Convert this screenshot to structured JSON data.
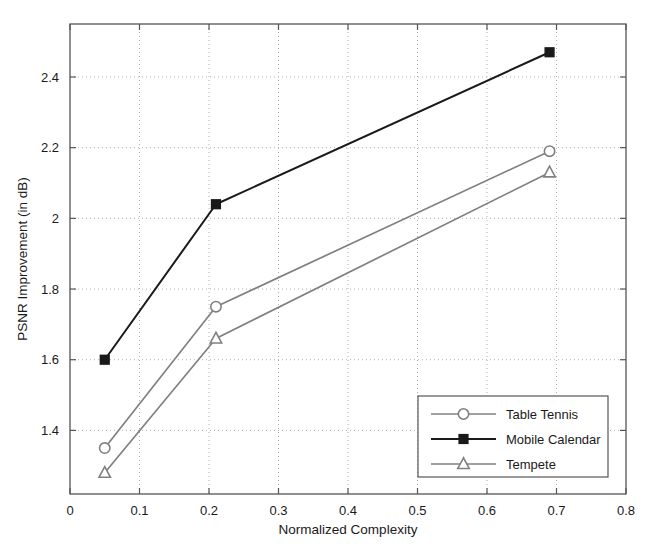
{
  "chart_data": {
    "type": "line",
    "title": "",
    "xlabel": "Normalized Complexity",
    "ylabel": "PSNR Improvement (in dB)",
    "xlim": [
      0,
      0.8
    ],
    "ylim": [
      1.22,
      2.55
    ],
    "xticks": [
      0,
      0.1,
      0.2,
      0.3,
      0.4,
      0.5,
      0.6,
      0.7,
      0.8
    ],
    "xticklabels": [
      "0",
      "0.1",
      "0.2",
      "0.3",
      "0.4",
      "0.5",
      "0.6",
      "0.7",
      "0.8"
    ],
    "yticks": [
      1.4,
      1.6,
      1.8,
      2.0,
      2.2,
      2.4
    ],
    "yticklabels": [
      "1.4",
      "1.6",
      "1.8",
      "2",
      "2.2",
      "2.4"
    ],
    "grid": true,
    "grid_style": "dotted",
    "legend_position": "lower right",
    "x": [
      0.05,
      0.21,
      0.69
    ],
    "series": [
      {
        "name": "Table Tennis",
        "marker": "circle",
        "color": "#808080",
        "values": [
          1.35,
          1.75,
          2.19
        ]
      },
      {
        "name": "Mobile Calendar",
        "marker": "square",
        "color": "#1a1a1a",
        "values": [
          1.6,
          2.04,
          2.47
        ]
      },
      {
        "name": "Tempete",
        "marker": "triangle",
        "color": "#808080",
        "values": [
          1.28,
          1.66,
          2.13
        ]
      }
    ]
  },
  "axes": {
    "frame_color": "#555555",
    "grid_color": "#b0b0b0",
    "background": "#ffffff"
  },
  "legend": {
    "border_color": "#555555",
    "background": "#ffffff",
    "entries": [
      {
        "label": "Table Tennis"
      },
      {
        "label": "Mobile Calendar"
      },
      {
        "label": "Tempete"
      }
    ]
  }
}
